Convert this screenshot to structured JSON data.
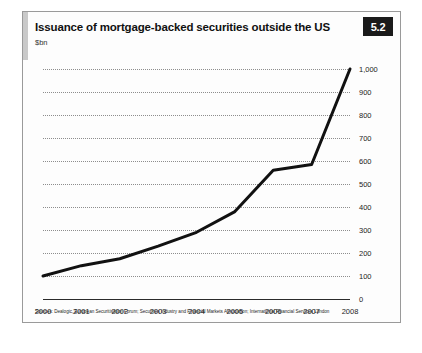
{
  "figure": {
    "number_badge": "5.2",
    "title": "Issuance of mortgage-backed securities outside the US",
    "units_label": "$bn",
    "source_note": "Sources: Dealogic, European Securitisation Forum; Securities Industry and Financial Markets Association; International Financial Services London"
  },
  "chart_data": {
    "type": "line",
    "title": "Issuance of mortgage-backed securities outside the US",
    "subtitle": "$bn",
    "xlabel": "",
    "ylabel": "$bn",
    "categories": [
      "2000",
      "2001",
      "2002",
      "2003",
      "2004",
      "2005",
      "2006",
      "2007",
      "2008"
    ],
    "x": [
      2000,
      2001,
      2002,
      2003,
      2004,
      2005,
      2006,
      2007,
      2008
    ],
    "values": [
      100,
      145,
      175,
      230,
      290,
      380,
      560,
      585,
      1000
    ],
    "series": [
      {
        "name": "Issuance of mortgage-backed securities outside the US",
        "values": [
          100,
          145,
          175,
          230,
          290,
          380,
          560,
          585,
          1000
        ]
      }
    ],
    "ylim": [
      0,
      1000
    ],
    "ytick_labels": [
      "0",
      "100",
      "200",
      "300",
      "400",
      "500",
      "600",
      "700",
      "800",
      "900",
      "1,000"
    ],
    "ytick_values": [
      0,
      100,
      200,
      300,
      400,
      500,
      600,
      700,
      800,
      900,
      1000
    ],
    "xtick_labels": [
      "2000",
      "2001",
      "2002",
      "2003",
      "2004",
      "2005",
      "2006",
      "2007",
      "2008"
    ],
    "grid": true,
    "grid_style": "dotted-horizontal",
    "legend": false,
    "legend_position": "none",
    "line_color": "#111111",
    "line_width": 3,
    "y_axis_position": "right"
  }
}
